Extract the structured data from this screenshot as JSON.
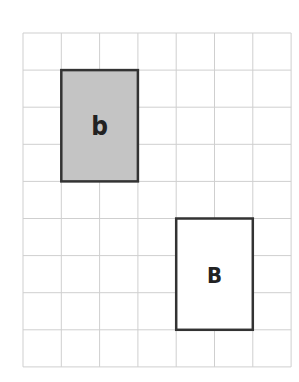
{
  "diagram": {
    "grid": {
      "origin_x": 23,
      "origin_y": 33,
      "columns": 7,
      "rows": 9,
      "cell_w": 38.3,
      "cell_h": 37.1,
      "line_color": "#cfcfcf"
    },
    "shapes": [
      {
        "id": "rect-b",
        "label": "b",
        "col": 1,
        "row": 1,
        "col_span": 2,
        "row_span": 3,
        "fill": "#c4c4c4",
        "stroke": "#333333"
      },
      {
        "id": "rect-B",
        "label": "B",
        "col": 4,
        "row": 5,
        "col_span": 2,
        "row_span": 3,
        "fill": "#ffffff",
        "stroke": "#333333"
      }
    ]
  }
}
